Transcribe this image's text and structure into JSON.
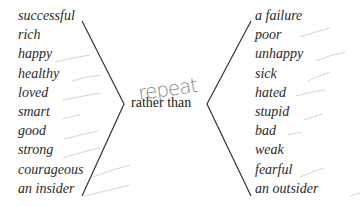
{
  "left_words": [
    "successful",
    "rich",
    "happy",
    "healthy",
    "loved",
    "smart",
    "good",
    "strong",
    "courageous",
    "an insider"
  ],
  "right_words": [
    "a failure",
    "poor",
    "unhappy",
    "sick",
    "hated",
    "stupid",
    "bad",
    "weak",
    "fearful",
    "an outsider"
  ],
  "center_text": "rather than",
  "handwritten_note": "repeat",
  "colors": {
    "text": "#2a2a2a",
    "bracket": "#333333",
    "handwriting": "#8a8a8a",
    "pencil_marks": "#d0d0d0"
  }
}
